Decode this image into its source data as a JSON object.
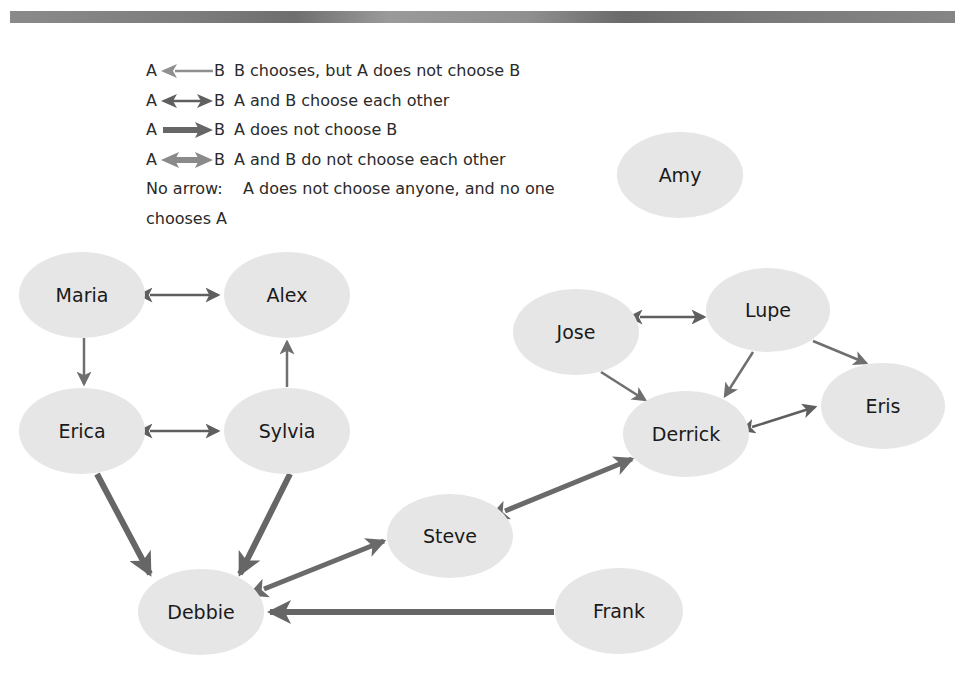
{
  "legend": {
    "rows": [
      {
        "a": "A",
        "b": "B",
        "arrow_style": "thin-light-left",
        "description": "B chooses, but A does not choose B"
      },
      {
        "a": "A",
        "b": "B",
        "arrow_style": "thin-dark-double",
        "description": "A and B choose each other"
      },
      {
        "a": "A",
        "b": "B",
        "arrow_style": "thick-dark-right",
        "description": "A does not choose B"
      },
      {
        "a": "A",
        "b": "B",
        "arrow_style": "thick-light-double",
        "description": "A and B do not choose each other"
      }
    ],
    "no_arrow_label": "No arrow:",
    "no_arrow_description": "A does not choose anyone, and no one",
    "no_arrow_description_cont": "chooses A"
  },
  "colors": {
    "node_fill": "#e6e6e6",
    "arrow_dark": "#5f5f5f",
    "arrow_light": "#8a8a8a",
    "top_bar": "#7d7d7d"
  },
  "nodes": [
    {
      "id": "amy",
      "label": "Amy",
      "cx": 680,
      "cy": 175
    },
    {
      "id": "maria",
      "label": "Maria",
      "cx": 82,
      "cy": 295
    },
    {
      "id": "alex",
      "label": "Alex",
      "cx": 287,
      "cy": 295
    },
    {
      "id": "erica",
      "label": "Erica",
      "cx": 82,
      "cy": 431
    },
    {
      "id": "sylvia",
      "label": "Sylvia",
      "cx": 287,
      "cy": 431
    },
    {
      "id": "jose",
      "label": "Jose",
      "cx": 576,
      "cy": 332
    },
    {
      "id": "lupe",
      "label": "Lupe",
      "cx": 768,
      "cy": 310
    },
    {
      "id": "derrick",
      "label": "Derrick",
      "cx": 686,
      "cy": 434
    },
    {
      "id": "eris",
      "label": "Eris",
      "cx": 883,
      "cy": 406
    },
    {
      "id": "steve",
      "label": "Steve",
      "cx": 450,
      "cy": 536
    },
    {
      "id": "debbie",
      "label": "Debbie",
      "cx": 201,
      "cy": 612
    },
    {
      "id": "frank",
      "label": "Frank",
      "cx": 619,
      "cy": 611
    }
  ],
  "edges": [
    {
      "from": "Maria",
      "to": "Alex",
      "type": "mutual-choose"
    },
    {
      "from": "Maria",
      "to": "Erica",
      "type": "one-way-choose"
    },
    {
      "from": "Sylvia",
      "to": "Alex",
      "type": "one-way-choose"
    },
    {
      "from": "Erica",
      "to": "Sylvia",
      "type": "mutual-choose"
    },
    {
      "from": "Erica",
      "to": "Debbie",
      "type": "not-choose"
    },
    {
      "from": "Sylvia",
      "to": "Debbie",
      "type": "not-choose"
    },
    {
      "from": "Steve",
      "to": "Debbie",
      "type": "mutual-not-choose"
    },
    {
      "from": "Frank",
      "to": "Debbie",
      "type": "not-choose"
    },
    {
      "from": "Steve",
      "to": "Derrick",
      "type": "mutual-not-choose"
    },
    {
      "from": "Jose",
      "to": "Lupe",
      "type": "mutual-choose"
    },
    {
      "from": "Jose",
      "to": "Derrick",
      "type": "one-way-choose"
    },
    {
      "from": "Lupe",
      "to": "Derrick",
      "type": "one-way-choose"
    },
    {
      "from": "Lupe",
      "to": "Eris",
      "type": "one-way-choose"
    },
    {
      "from": "Derrick",
      "to": "Eris",
      "type": "mutual-choose"
    }
  ]
}
